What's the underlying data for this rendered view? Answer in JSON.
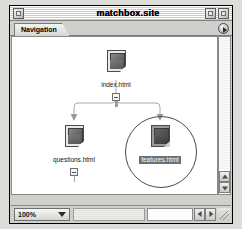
{
  "window": {
    "title": "matchbox.site",
    "close_label": "close",
    "zoom_label": "zoom",
    "collapse_label": "collapse"
  },
  "tabs": [
    {
      "label": "Navigation"
    }
  ],
  "tab_arrow": {
    "label": "▶"
  },
  "sitemap": {
    "nodes": [
      {
        "id": "index",
        "label": "index.html",
        "selected": false,
        "icon": "document-icon",
        "has_collapse_box": true
      },
      {
        "id": "questions",
        "label": "questions.html",
        "selected": false,
        "icon": "document-icon",
        "has_collapse_box": true
      },
      {
        "id": "features",
        "label": "features.html",
        "selected": true,
        "icon": "document-icon",
        "has_collapse_box": false
      }
    ]
  },
  "statusbar": {
    "zoom_value": "100%",
    "zoom_options": [
      "25%",
      "50%",
      "75%",
      "100%",
      "200%"
    ],
    "scroll_left_label": "◀",
    "scroll_right_label": "▶",
    "resize_grip": "resize-grip"
  },
  "scrollbar": {
    "up_label": "▲",
    "down_label": "▼"
  },
  "colors": {
    "window_chrome": "#cfcfcb",
    "canvas": "#ffffff",
    "selection": "#6f6f6f",
    "line": "#a8a8a8"
  }
}
